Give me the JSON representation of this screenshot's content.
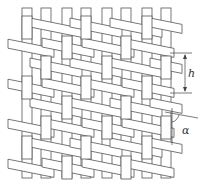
{
  "diagram": {
    "type": "twill weave schematic",
    "vertical_strip_count": 8,
    "horizontal_strip_direction": "slanted downward to right",
    "colors": {
      "stroke": "#555555",
      "fill": "#ffffff"
    },
    "annotations": {
      "height_label": "h",
      "angle_label": "α"
    }
  }
}
